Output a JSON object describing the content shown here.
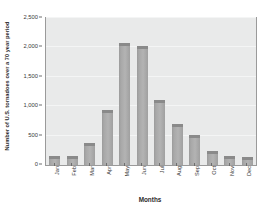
{
  "chart_data": {
    "type": "bar",
    "title": "",
    "subtitle": "",
    "xlabel": "Months",
    "ylabel": "Number of U.S. tornadoes over a 70 year period",
    "categories": [
      "Jan",
      "Feb",
      "Mar",
      "Apr",
      "May",
      "Jun",
      "Jul",
      "Aug",
      "Sep",
      "Oct",
      "Nov",
      "Dec"
    ],
    "values": [
      100,
      110,
      330,
      880,
      2030,
      1970,
      1060,
      640,
      460,
      190,
      100,
      80
    ],
    "ylim": [
      0,
      2500
    ],
    "yticks": [
      0,
      500,
      1000,
      1500,
      2000,
      2500
    ],
    "ytick_labels": [
      "0",
      "500",
      "1,000",
      "1,500",
      "2,000",
      "2,500"
    ],
    "grid": true,
    "grid_axis": "y",
    "legend": false,
    "legend_position": "none",
    "bar_color": "#aaaaaa",
    "bar_shadow_color": "#6f6f6f",
    "plot_background": "#e9eaea",
    "gridline_color": "#f4f5f5",
    "axis_color": "#9a9a9a",
    "text_color": "#2b2b2b"
  }
}
